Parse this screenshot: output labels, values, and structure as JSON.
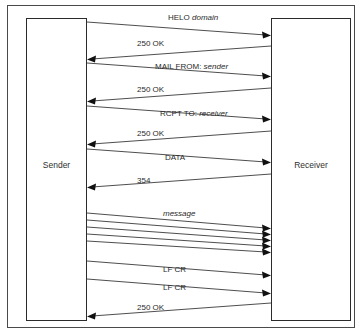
{
  "diagram": {
    "type": "sequence-diagram",
    "background_color": "#ffffff",
    "line_color": "#3a3a3a",
    "frame_color": "#4a4a4a",
    "actors": [
      {
        "id": "sender",
        "label": "Sender",
        "side": "left"
      },
      {
        "id": "receiver",
        "label": "Receiver",
        "side": "right"
      }
    ],
    "messages": [
      {
        "index": 0,
        "command": "HELO",
        "argument": "domain",
        "direction": "sender-to-receiver"
      },
      {
        "index": 1,
        "command": "250 OK",
        "argument": "",
        "direction": "receiver-to-sender"
      },
      {
        "index": 2,
        "command": "MAIL FROM:",
        "argument": "sender",
        "direction": "sender-to-receiver"
      },
      {
        "index": 3,
        "command": "250 OK",
        "argument": "",
        "direction": "receiver-to-sender"
      },
      {
        "index": 4,
        "command": "RCPT TO:",
        "argument": "receiver",
        "direction": "sender-to-receiver"
      },
      {
        "index": 5,
        "command": "250 OK",
        "argument": "",
        "direction": "receiver-to-sender"
      },
      {
        "index": 6,
        "command": "DATA",
        "argument": "",
        "direction": "sender-to-receiver"
      },
      {
        "index": 7,
        "command": "354",
        "argument": "",
        "direction": "receiver-to-sender"
      },
      {
        "index": 8,
        "command": "",
        "argument": "message",
        "direction": "sender-to-receiver",
        "repeat": 5
      },
      {
        "index": 9,
        "command": "LF CR",
        "argument": "",
        "direction": "sender-to-receiver"
      },
      {
        "index": 10,
        "command": "LF CR",
        "argument": "",
        "direction": "sender-to-receiver"
      },
      {
        "index": 11,
        "command": "250 OK",
        "argument": "",
        "direction": "receiver-to-sender"
      }
    ]
  }
}
